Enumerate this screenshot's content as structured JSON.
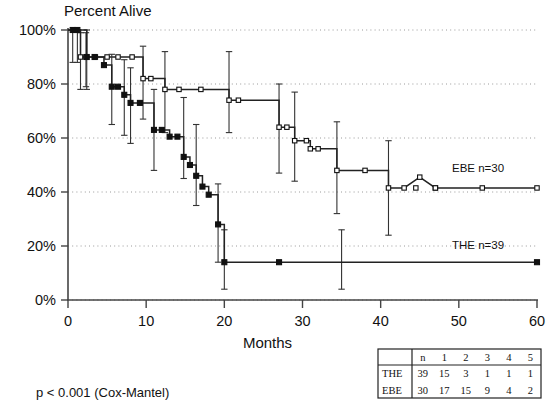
{
  "figure": {
    "title": "Percent Alive",
    "pvalue_note": "p < 0.001 (Cox-Mantel)",
    "axis": {
      "xlabel": "Months",
      "ylabel": "Percent Alive",
      "xticks": [
        "0",
        "10",
        "20",
        "30",
        "40",
        "50",
        "60"
      ],
      "yticks": [
        "0%",
        "20%",
        "40%",
        "60%",
        "80%",
        "100%"
      ]
    },
    "labels": {
      "ebe": "EBE  n=30",
      "the": "THE  n=39"
    }
  },
  "risk_table": {
    "corner": "",
    "headers": [
      "n",
      "1",
      "2",
      "3",
      "4",
      "5"
    ],
    "rows": [
      {
        "label": "THE",
        "values": [
          "39",
          "15",
          "3",
          "1",
          "1",
          "1"
        ]
      },
      {
        "label": "EBE",
        "values": [
          "30",
          "17",
          "15",
          "9",
          "4",
          "2"
        ]
      }
    ]
  },
  "chart_data": {
    "type": "line",
    "title": "Percent Alive",
    "subtitle": "Kaplan-Meier survival curves, EBE vs THE",
    "xlabel": "Months",
    "ylabel": "Percent Alive",
    "xlim": [
      0,
      60
    ],
    "ylim": [
      0,
      100
    ],
    "xticks": [
      0,
      10,
      20,
      30,
      40,
      50,
      60
    ],
    "yticks": [
      0,
      20,
      40,
      60,
      80,
      100
    ],
    "grid": "horizontal-dotted",
    "legend_position": "inline-right",
    "annotations": [
      "p < 0.001 (Cox-Mantel)"
    ],
    "series": [
      {
        "name": "EBE",
        "n": 30,
        "label": "EBE  n=30",
        "marker": "open-square",
        "step_points": [
          [
            0,
            100
          ],
          [
            1.0,
            100
          ],
          [
            1.6,
            100
          ],
          [
            1.6,
            90
          ],
          [
            2.3,
            90
          ],
          [
            3.5,
            90
          ],
          [
            5.0,
            90
          ],
          [
            6.4,
            90
          ],
          [
            8.2,
            90
          ],
          [
            9.6,
            90
          ],
          [
            9.6,
            82
          ],
          [
            10.6,
            82
          ],
          [
            12.4,
            82
          ],
          [
            12.4,
            78
          ],
          [
            14.2,
            78
          ],
          [
            17.0,
            78
          ],
          [
            20.6,
            78
          ],
          [
            20.6,
            74
          ],
          [
            21.8,
            74
          ],
          [
            27.0,
            74
          ],
          [
            27.0,
            64
          ],
          [
            28.0,
            64
          ],
          [
            29.0,
            64
          ],
          [
            29.0,
            59
          ],
          [
            30.5,
            59
          ],
          [
            31.0,
            59
          ],
          [
            31.0,
            56
          ],
          [
            32.0,
            56
          ],
          [
            34.4,
            56
          ],
          [
            34.4,
            48
          ],
          [
            38.0,
            48
          ],
          [
            41.0,
            48
          ],
          [
            41.0,
            41.5
          ],
          [
            43.0,
            41.5
          ],
          [
            45.0,
            45.5
          ],
          [
            47.0,
            41.5
          ],
          [
            50.0,
            41.5
          ],
          [
            53.0,
            41.5
          ],
          [
            60.0,
            41.5
          ]
        ],
        "censor_marks": [
          [
            2.3,
            90
          ],
          [
            3.5,
            90
          ],
          [
            5.0,
            90
          ],
          [
            6.4,
            90
          ],
          [
            8.2,
            90
          ],
          [
            10.6,
            82
          ],
          [
            14.2,
            78
          ],
          [
            17.0,
            78
          ],
          [
            21.8,
            74
          ],
          [
            28.0,
            64
          ],
          [
            30.5,
            59
          ],
          [
            32.0,
            56
          ],
          [
            38.0,
            48
          ],
          [
            43.0,
            41.5
          ],
          [
            44.5,
            41.5
          ],
          [
            47.0,
            41.5
          ],
          [
            53.0,
            41.5
          ],
          [
            60.0,
            41.5
          ]
        ],
        "error_bars": [
          {
            "x": 1.6,
            "y": 90,
            "low": 78,
            "high": 99
          },
          {
            "x": 2.3,
            "y": 90,
            "low": 79,
            "high": 99
          },
          {
            "x": 9.6,
            "y": 82,
            "low": 67,
            "high": 94
          },
          {
            "x": 12.4,
            "y": 78,
            "low": 62,
            "high": 92
          },
          {
            "x": 20.6,
            "y": 78,
            "low": 62,
            "high": 92
          },
          {
            "x": 27.0,
            "y": 64,
            "low": 47,
            "high": 80
          },
          {
            "x": 29.0,
            "y": 59,
            "low": 44,
            "high": 77
          },
          {
            "x": 34.4,
            "y": 48,
            "low": 32,
            "high": 66
          },
          {
            "x": 41.0,
            "y": 41.5,
            "low": 24,
            "high": 59
          }
        ]
      },
      {
        "name": "THE",
        "n": 39,
        "label": "THE  n=39",
        "marker": "filled-square",
        "step_points": [
          [
            0,
            100
          ],
          [
            0.6,
            100
          ],
          [
            1.2,
            100
          ],
          [
            2.4,
            100
          ],
          [
            2.4,
            90
          ],
          [
            3.4,
            90
          ],
          [
            4.6,
            90
          ],
          [
            4.6,
            87
          ],
          [
            5.6,
            87
          ],
          [
            5.6,
            79
          ],
          [
            6.4,
            79
          ],
          [
            7.2,
            79
          ],
          [
            7.2,
            76
          ],
          [
            8.0,
            76
          ],
          [
            8.0,
            73
          ],
          [
            9.2,
            73
          ],
          [
            11.0,
            73
          ],
          [
            11.0,
            63
          ],
          [
            12.0,
            63
          ],
          [
            13.0,
            63
          ],
          [
            13.0,
            60.5
          ],
          [
            14.0,
            60.5
          ],
          [
            14.8,
            60.5
          ],
          [
            14.8,
            53
          ],
          [
            15.6,
            53
          ],
          [
            15.6,
            50
          ],
          [
            16.4,
            50
          ],
          [
            16.4,
            46
          ],
          [
            17.2,
            46
          ],
          [
            17.2,
            42
          ],
          [
            18.0,
            42
          ],
          [
            18.0,
            39
          ],
          [
            19.2,
            39
          ],
          [
            19.2,
            28
          ],
          [
            20.0,
            28
          ],
          [
            20.0,
            14
          ],
          [
            27.0,
            14
          ],
          [
            35.0,
            14
          ],
          [
            60.0,
            14
          ]
        ],
        "censor_marks": [
          [
            0.6,
            100
          ],
          [
            1.2,
            100
          ],
          [
            3.4,
            90
          ],
          [
            6.4,
            79
          ],
          [
            9.2,
            73
          ],
          [
            12.0,
            63
          ],
          [
            14.0,
            60.5
          ],
          [
            27.0,
            14
          ],
          [
            60.0,
            14
          ]
        ],
        "error_bars": [
          {
            "x": 0.6,
            "y": 100,
            "low": 88,
            "high": 100
          },
          {
            "x": 1.2,
            "y": 100,
            "low": 88,
            "high": 100
          },
          {
            "x": 2.4,
            "y": 90,
            "low": 78,
            "high": 100
          },
          {
            "x": 5.6,
            "y": 79,
            "low": 65,
            "high": 91
          },
          {
            "x": 7.2,
            "y": 76,
            "low": 61,
            "high": 89
          },
          {
            "x": 8.0,
            "y": 73,
            "low": 58,
            "high": 86
          },
          {
            "x": 11.0,
            "y": 63,
            "low": 48,
            "high": 78
          },
          {
            "x": 14.8,
            "y": 60.5,
            "low": 45,
            "high": 75
          },
          {
            "x": 16.4,
            "y": 50,
            "low": 35,
            "high": 65
          },
          {
            "x": 19.2,
            "y": 28,
            "low": 14,
            "high": 43
          },
          {
            "x": 20.0,
            "y": 14,
            "low": 4,
            "high": 26
          },
          {
            "x": 35.0,
            "y": 14,
            "low": 4,
            "high": 26
          }
        ]
      }
    ]
  }
}
